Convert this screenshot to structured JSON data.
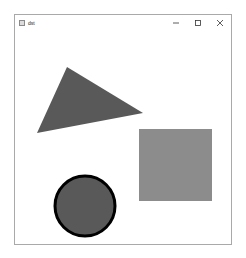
{
  "window": {
    "title": "dst",
    "controls": {
      "minimize": "minimize-icon",
      "maximize": "maximize-icon",
      "close": "close-icon"
    }
  },
  "canvas": {
    "shapes": [
      {
        "type": "triangle",
        "points": [
          [
            52,
            36
          ],
          [
            128,
            82
          ],
          [
            22,
            102
          ]
        ],
        "fill": "#595959"
      },
      {
        "type": "rectangle",
        "x": 124,
        "y": 98,
        "width": 73,
        "height": 72,
        "fill": "#8c8c8c"
      },
      {
        "type": "circle",
        "cx": 70,
        "cy": 175,
        "r": 30,
        "fill": "#595959",
        "stroke": "#000000",
        "stroke_width": 3
      }
    ]
  },
  "colors": {
    "window_border": "#a9a9a9",
    "triangle": "#595959",
    "square": "#8c8c8c",
    "circle_fill": "#595959",
    "circle_stroke": "#000000"
  },
  "caption": {
    "text": ""
  }
}
